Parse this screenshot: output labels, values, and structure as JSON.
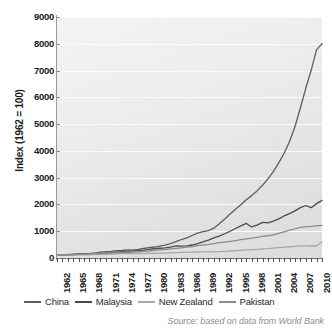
{
  "chart_data": {
    "type": "line",
    "title": "",
    "subtitle": "",
    "xlabel": "",
    "ylabel": "Index (1962 = 100)",
    "xlim": [
      1962,
      2011
    ],
    "ylim": [
      0,
      9000
    ],
    "ytick_step": 1000,
    "grid": true,
    "legend_position": "bottom",
    "source": "Source: based on data from World Bank",
    "ytick_labels": [
      "9000",
      "8000",
      "7000",
      "6000",
      "5000",
      "4000",
      "3000",
      "2000",
      "1000",
      "0"
    ],
    "ytick_values": [
      9000,
      8000,
      7000,
      6000,
      5000,
      4000,
      3000,
      2000,
      1000,
      0
    ],
    "xtick_labels": [
      "1962",
      "1965",
      "1968",
      "1971",
      "1974",
      "1977",
      "1980",
      "1983",
      "1986",
      "1989",
      "1992",
      "1995",
      "1998",
      "2001",
      "2004",
      "2007",
      "2010"
    ],
    "xtick_values": [
      1962,
      1965,
      1968,
      1971,
      1974,
      1977,
      1980,
      1983,
      1986,
      1989,
      1992,
      1995,
      1998,
      2001,
      2004,
      2007,
      2010
    ],
    "x": [
      1962,
      1963,
      1964,
      1965,
      1966,
      1967,
      1968,
      1969,
      1970,
      1971,
      1972,
      1973,
      1974,
      1975,
      1976,
      1977,
      1978,
      1979,
      1980,
      1981,
      1982,
      1983,
      1984,
      1985,
      1986,
      1987,
      1988,
      1989,
      1990,
      1991,
      1992,
      1993,
      1994,
      1995,
      1996,
      1997,
      1998,
      1999,
      2000,
      2001,
      2002,
      2003,
      2004,
      2005,
      2006,
      2007,
      2008,
      2009,
      2010,
      2011
    ],
    "series": [
      {
        "name": "China",
        "color": "#5e5e5e",
        "values": [
          100,
          112,
          128,
          143,
          155,
          150,
          164,
          186,
          217,
          235,
          250,
          275,
          280,
          300,
          295,
          320,
          355,
          385,
          410,
          440,
          480,
          535,
          610,
          690,
          755,
          840,
          930,
          985,
          1020,
          1115,
          1275,
          1450,
          1640,
          1820,
          1990,
          2175,
          2330,
          2505,
          2715,
          2955,
          3225,
          3550,
          3910,
          4350,
          4900,
          5600,
          6340,
          7010,
          7780,
          8000
        ]
      },
      {
        "name": "Malaysia",
        "color": "#4a4a4a",
        "values": [
          100,
          106,
          115,
          126,
          134,
          141,
          150,
          163,
          172,
          182,
          198,
          220,
          238,
          236,
          258,
          278,
          295,
          320,
          345,
          365,
          380,
          410,
          450,
          440,
          450,
          485,
          540,
          600,
          670,
          750,
          820,
          905,
          1000,
          1100,
          1200,
          1290,
          1160,
          1230,
          1330,
          1310,
          1380,
          1460,
          1570,
          1660,
          1760,
          1880,
          1960,
          1880,
          2030,
          2150
        ]
      },
      {
        "name": "New Zealand",
        "color": "#a8a8a8",
        "values": [
          100,
          104,
          110,
          116,
          120,
          118,
          122,
          128,
          134,
          138,
          145,
          155,
          162,
          160,
          164,
          166,
          168,
          172,
          178,
          182,
          186,
          190,
          200,
          208,
          212,
          218,
          224,
          228,
          232,
          230,
          236,
          248,
          262,
          275,
          288,
          300,
          306,
          320,
          336,
          348,
          366,
          386,
          404,
          420,
          436,
          452,
          456,
          448,
          458,
          600
        ]
      },
      {
        "name": "Pakistan",
        "color": "#8c8c8c",
        "values": [
          100,
          108,
          118,
          126,
          134,
          144,
          156,
          166,
          176,
          180,
          186,
          196,
          206,
          214,
          224,
          234,
          248,
          262,
          282,
          300,
          318,
          340,
          358,
          380,
          404,
          430,
          460,
          484,
          508,
          540,
          572,
          592,
          620,
          652,
          686,
          712,
          740,
          772,
          806,
          830,
          868,
          920,
          980,
          1040,
          1090,
          1140,
          1170,
          1180,
          1200,
          1215
        ]
      }
    ]
  },
  "legend": {
    "items": [
      {
        "label": "China",
        "color": "#5e5e5e"
      },
      {
        "label": "Malaysia",
        "color": "#4a4a4a"
      },
      {
        "label": "New Zealand",
        "color": "#a8a8a8"
      },
      {
        "label": "Pakistan",
        "color": "#8c8c8c"
      }
    ]
  },
  "source_note": "Source: based on data from World Bank"
}
